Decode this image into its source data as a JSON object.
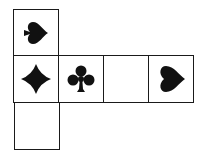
{
  "diagram": {
    "type": "cube-net",
    "ink_color": "#111111",
    "cells": [
      {
        "id": "top",
        "row": 0,
        "col": 0,
        "symbol": "spade",
        "rotation": 90
      },
      {
        "id": "middle-1",
        "row": 1,
        "col": 0,
        "symbol": "diamond",
        "rotation": 0
      },
      {
        "id": "middle-2",
        "row": 1,
        "col": 1,
        "symbol": "club",
        "rotation": 0
      },
      {
        "id": "middle-3",
        "row": 1,
        "col": 2,
        "symbol": "blank",
        "rotation": 0
      },
      {
        "id": "middle-4",
        "row": 1,
        "col": 3,
        "symbol": "heart",
        "rotation": -90
      },
      {
        "id": "bottom",
        "row": 2,
        "col": 0,
        "symbol": "blank",
        "rotation": 0
      }
    ]
  }
}
